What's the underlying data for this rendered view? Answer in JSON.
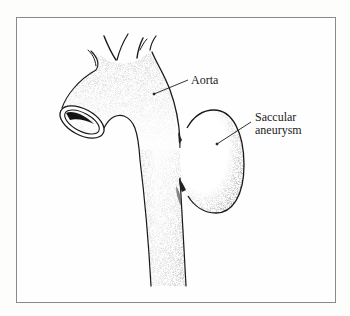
{
  "figure": {
    "labels": {
      "aorta": "Aorta",
      "aneurysm_line1": "Saccular",
      "aneurysm_line2": "aneurysm"
    }
  },
  "colors": {
    "ink": "#1a1a1a",
    "frame": "#8a8a8a",
    "background": "#fefefe",
    "stipple": "#555555"
  }
}
